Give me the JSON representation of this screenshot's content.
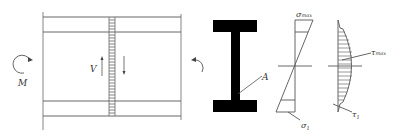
{
  "figure": {
    "beam_view": {
      "moment_label": "M",
      "shear_label": "V"
    },
    "cross_section": {
      "point_label": "A"
    },
    "normal_stress_diagram": {
      "top_label": "σ",
      "top_sub": "max",
      "bottom_label": "σ",
      "bottom_sub": "1"
    },
    "shear_stress_diagram": {
      "max_label": "τ",
      "max_sub": "max",
      "bottom_label": "τ",
      "bottom_sub": "1"
    }
  },
  "colors": {
    "line": "#555555",
    "fill": "#000000",
    "background": "#ffffff"
  }
}
